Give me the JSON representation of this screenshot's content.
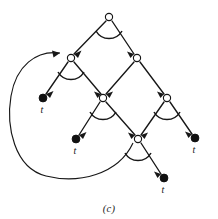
{
  "figure": {
    "caption": "(c)",
    "kind": "and-or-proof-tree",
    "colors": {
      "stroke": "#171717",
      "node_fill": "#ffffff",
      "terminal_fill": "#111111",
      "background": "#ffffff"
    },
    "nodes": [
      {
        "id": "n-root",
        "name": "root-node",
        "type": "open",
        "x": 109,
        "y": 17,
        "r": 3.6,
        "has_conjunction_arc": true
      },
      {
        "id": "n-left",
        "name": "left-inner-node",
        "type": "open",
        "x": 71,
        "y": 58,
        "r": 3.6,
        "has_conjunction_arc": true
      },
      {
        "id": "n-right",
        "name": "right-inner-node",
        "type": "open",
        "x": 137,
        "y": 58,
        "r": 3.6,
        "has_conjunction_arc": false
      },
      {
        "id": "n-center",
        "name": "center-node",
        "type": "open",
        "x": 103,
        "y": 98,
        "r": 3.6,
        "has_conjunction_arc": true
      },
      {
        "id": "n-right-low",
        "name": "right-lower-node",
        "type": "open",
        "x": 167,
        "y": 98,
        "r": 3.6,
        "has_conjunction_arc": true
      },
      {
        "id": "n-bottom",
        "name": "bottom-node",
        "type": "open",
        "x": 138,
        "y": 139,
        "r": 3.6,
        "has_conjunction_arc": true
      },
      {
        "id": "t-left",
        "name": "terminal-left",
        "type": "terminal",
        "x": 43,
        "y": 98,
        "r": 3.9,
        "label": "t",
        "label_x": 42,
        "label_y": 113
      },
      {
        "id": "t-center-left",
        "name": "terminal-center-left",
        "type": "terminal",
        "x": 76,
        "y": 139,
        "r": 3.9,
        "label": "t",
        "label_x": 75,
        "label_y": 154
      },
      {
        "id": "t-right",
        "name": "terminal-right",
        "type": "terminal",
        "x": 195,
        "y": 138,
        "r": 3.9,
        "label": "t",
        "label_x": 194,
        "label_y": 153
      },
      {
        "id": "t-bottom",
        "name": "terminal-bottom",
        "type": "terminal",
        "x": 164,
        "y": 178,
        "r": 3.9,
        "label": "t",
        "label_x": 163,
        "label_y": 193
      }
    ],
    "edges": [
      {
        "id": "e-root-left",
        "name": "edge-root-to-left-inner",
        "from": "n-root",
        "to": "n-left",
        "x1": 106,
        "y1": 21,
        "x2": 74,
        "y2": 54
      },
      {
        "id": "e-root-right",
        "name": "edge-root-to-right-inner",
        "from": "n-root",
        "to": "n-right",
        "x1": 112,
        "y1": 21,
        "x2": 134,
        "y2": 54
      },
      {
        "id": "e-left-terminal",
        "name": "edge-left-inner-to-terminal",
        "from": "n-left",
        "to": "t-left",
        "x1": 68,
        "y1": 62,
        "x2": 46,
        "y2": 94
      },
      {
        "id": "e-left-center",
        "name": "edge-left-inner-to-center",
        "from": "n-left",
        "to": "n-center",
        "x1": 74,
        "y1": 62,
        "x2": 101,
        "y2": 94
      },
      {
        "id": "e-right-center",
        "name": "edge-right-inner-to-center",
        "from": "n-right",
        "to": "n-center",
        "x1": 134,
        "y1": 62,
        "x2": 106,
        "y2": 94
      },
      {
        "id": "e-right-rightlow",
        "name": "edge-right-inner-to-lower",
        "from": "n-right",
        "to": "n-right-low",
        "x1": 140,
        "y1": 62,
        "x2": 164,
        "y2": 94
      },
      {
        "id": "e-center-terminal",
        "name": "edge-center-to-terminal",
        "from": "n-center",
        "to": "t-center-left",
        "x1": 100,
        "y1": 102,
        "x2": 79,
        "y2": 135
      },
      {
        "id": "e-center-bottom",
        "name": "edge-center-to-bottom",
        "from": "n-center",
        "to": "n-bottom",
        "x1": 106,
        "y1": 102,
        "x2": 135,
        "y2": 135
      },
      {
        "id": "e-rightlow-bottom",
        "name": "edge-lower-to-bottom",
        "from": "n-right-low",
        "to": "n-bottom",
        "x1": 164,
        "y1": 102,
        "x2": 141,
        "y2": 135
      },
      {
        "id": "e-rightlow-terminal",
        "name": "edge-lower-to-terminal",
        "from": "n-right-low",
        "to": "t-right",
        "x1": 170,
        "y1": 102,
        "x2": 192,
        "y2": 134
      },
      {
        "id": "e-bottom-terminal",
        "name": "edge-bottom-to-terminal",
        "from": "n-bottom",
        "to": "t-bottom",
        "x1": 141,
        "y1": 143,
        "x2": 161,
        "y2": 174
      }
    ],
    "feedback_edge": {
      "id": "e-feedback",
      "name": "feedback-loop-edge",
      "from": "n-bottom",
      "to": "n-left",
      "path": "M 133 143 C 118 175, 78 184, 46 176 C 14 168, 6 126, 11 96 C 16 66, 36 50, 60 53"
    },
    "conjunction_arcs": [
      {
        "id": "arc-root",
        "name": "conjunction-arc-root",
        "node": "n-root",
        "path": "M 96 31 A 15 15 0 0 0 122 31"
      },
      {
        "id": "arc-left",
        "name": "conjunction-arc-left-inner",
        "node": "n-left",
        "path": "M 58 72 A 15 15 0 0 0 84 72"
      },
      {
        "id": "arc-center",
        "name": "conjunction-arc-center",
        "node": "n-center",
        "path": "M 90 112 A 15 15 0 0 0 116 112"
      },
      {
        "id": "arc-rightlow",
        "name": "conjunction-arc-lower-right",
        "node": "n-right-low",
        "path": "M 154 112 A 15 15 0 0 0 180 112"
      },
      {
        "id": "arc-bottom",
        "name": "conjunction-arc-bottom",
        "node": "n-bottom",
        "path": "M 125 153 A 15 15 0 0 0 151 153"
      }
    ]
  }
}
